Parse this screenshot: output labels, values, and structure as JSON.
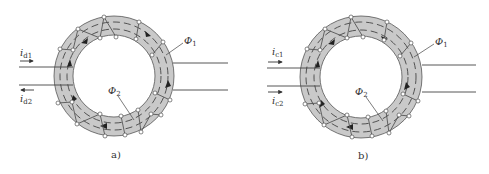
{
  "figures": [
    {
      "id": "a",
      "caption": "a)",
      "center": [
        114,
        76
      ],
      "input_currents": [
        {
          "symbol": "i",
          "subscript": "d1",
          "direction": "right"
        },
        {
          "symbol": "i",
          "subscript": "d2",
          "direction": "left"
        }
      ],
      "flux_labels": [
        {
          "symbol": "Φ",
          "subscript": "1"
        },
        {
          "symbol": "Φ",
          "subscript": "2"
        }
      ]
    },
    {
      "id": "b",
      "caption": "b)",
      "center": [
        361,
        77
      ],
      "input_currents": [
        {
          "symbol": "i",
          "subscript": "c1",
          "direction": "right"
        },
        {
          "symbol": "i",
          "subscript": "c2",
          "direction": "right"
        }
      ],
      "flux_labels": [
        {
          "symbol": "Φ",
          "subscript": "1"
        },
        {
          "symbol": "Φ",
          "subscript": "2"
        }
      ]
    }
  ],
  "colors": {
    "core_fill": "#c9c9c9",
    "line": "#444444",
    "background": "#ffffff"
  }
}
